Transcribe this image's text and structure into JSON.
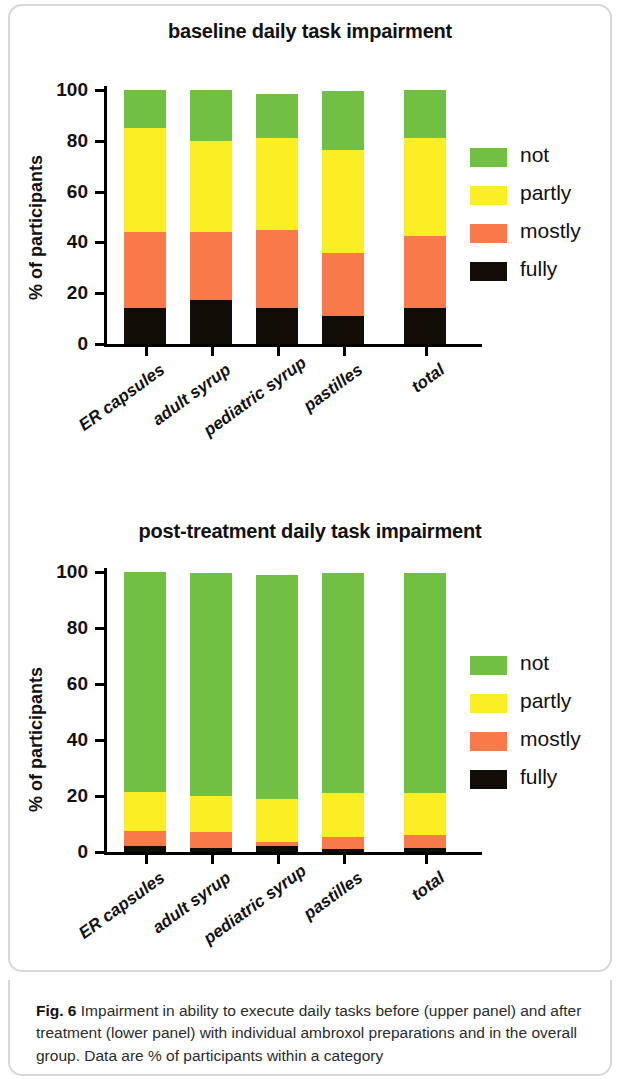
{
  "figure": {
    "caption_label": "Fig. 6",
    "caption_text": " Impairment in ability to execute daily tasks before (upper panel) and after treatment (lower panel) with individual ambroxol preparations and in the overall group. Data are % of participants within a category"
  },
  "colors": {
    "not": "#72c043",
    "partly": "#fbee23",
    "mostly": "#f8794a",
    "fully": "#120d07",
    "axis": "#000000",
    "frame": "#d8d8d8"
  },
  "legend": {
    "items": [
      {
        "label": "not",
        "color_key": "not"
      },
      {
        "label": "partly",
        "color_key": "partly"
      },
      {
        "label": "mostly",
        "color_key": "mostly"
      },
      {
        "label": "fully",
        "color_key": "fully"
      }
    ]
  },
  "chart_data": [
    {
      "type": "bar",
      "subtype": "stacked-bar-100",
      "title": "baseline daily task impairment",
      "xlabel": "",
      "ylabel": "% of participants",
      "ylim": [
        0,
        100
      ],
      "yticks": [
        0,
        20,
        40,
        60,
        80,
        100
      ],
      "ytick_labels": [
        "0",
        "20",
        "40",
        "60",
        "80",
        "100"
      ],
      "grid": false,
      "legend_position": "right",
      "categories": [
        "ER capsules",
        "adult syrup",
        "pediatric syrup",
        "pastilles",
        "total"
      ],
      "series": [
        {
          "name": "fully",
          "color": "#120d07",
          "values": [
            14.0,
            17.5,
            14.0,
            11.0,
            14.0
          ]
        },
        {
          "name": "mostly",
          "color": "#f8794a",
          "values": [
            30.0,
            26.5,
            31.0,
            25.0,
            28.5
          ]
        },
        {
          "name": "partly",
          "color": "#fbee23",
          "values": [
            41.0,
            36.0,
            36.0,
            40.5,
            38.5
          ]
        },
        {
          "name": "not",
          "color": "#72c043",
          "values": [
            15.0,
            20.0,
            17.5,
            23.0,
            19.0
          ]
        }
      ],
      "cumulative_tops": {
        "fully": [
          14.0,
          17.5,
          14.0,
          11.0,
          14.0
        ],
        "mostly": [
          44.0,
          44.0,
          45.0,
          36.0,
          42.5
        ],
        "partly": [
          85.0,
          80.0,
          81.0,
          76.5,
          81.0
        ],
        "not": [
          100.0,
          100.0,
          98.5,
          99.5,
          100.0
        ]
      }
    },
    {
      "type": "bar",
      "subtype": "stacked-bar-100",
      "title": "post-treatment daily task impairment",
      "xlabel": "",
      "ylabel": "% of participants",
      "ylim": [
        0,
        100
      ],
      "yticks": [
        0,
        20,
        40,
        60,
        80,
        100
      ],
      "ytick_labels": [
        "0",
        "20",
        "40",
        "60",
        "80",
        "100"
      ],
      "grid": false,
      "legend_position": "right",
      "categories": [
        "ER capsules",
        "adult syrup",
        "pediatric syrup",
        "pastilles",
        "total"
      ],
      "series": [
        {
          "name": "fully",
          "color": "#120d07",
          "values": [
            2.0,
            1.5,
            2.0,
            1.0,
            1.5
          ]
        },
        {
          "name": "mostly",
          "color": "#f8794a",
          "values": [
            5.5,
            5.5,
            1.5,
            4.5,
            4.5
          ]
        },
        {
          "name": "partly",
          "color": "#fbee23",
          "values": [
            14.0,
            13.0,
            15.5,
            15.5,
            15.0
          ]
        },
        {
          "name": "not",
          "color": "#72c043",
          "values": [
            78.5,
            79.5,
            80.0,
            78.5,
            78.5
          ]
        }
      ],
      "cumulative_tops": {
        "fully": [
          2.0,
          1.5,
          2.0,
          1.0,
          1.5
        ],
        "mostly": [
          7.5,
          7.0,
          3.5,
          5.5,
          6.0
        ],
        "partly": [
          21.5,
          20.0,
          19.0,
          21.0,
          21.0
        ],
        "not": [
          100.0,
          99.5,
          99.0,
          99.5,
          99.5
        ]
      }
    }
  ]
}
